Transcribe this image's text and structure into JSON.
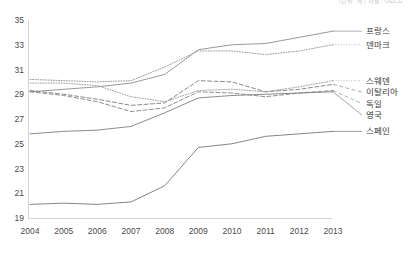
{
  "note": "(단위: 세) 자료: OECD",
  "chart_data": {
    "type": "line",
    "title": "",
    "xlabel": "",
    "ylabel": "",
    "grid": false,
    "legend_position": "right",
    "categories": [
      2004,
      2005,
      2006,
      2007,
      2008,
      2009,
      2010,
      2011,
      2012,
      2013
    ],
    "ylim": [
      19,
      35
    ],
    "ytick_step": 2,
    "yticks": [
      19,
      21,
      23,
      25,
      27,
      29,
      31,
      33,
      35
    ],
    "series": [
      {
        "name": "프랑스",
        "style": "solid",
        "color": "#8d8d8d",
        "values": [
          29.2,
          29.4,
          29.6,
          29.9,
          30.6,
          32.6,
          33.0,
          33.1,
          33.6,
          34.1
        ]
      },
      {
        "name": "덴마크",
        "style": "dotted",
        "color": "#9a9a9a",
        "values": [
          30.2,
          30.1,
          30.0,
          30.1,
          31.2,
          32.5,
          32.5,
          32.2,
          32.5,
          33.0
        ]
      },
      {
        "name": "스웨덴",
        "style": "dotted",
        "color": "#a0a0a0",
        "values": [
          29.9,
          29.9,
          29.7,
          28.8,
          28.4,
          29.3,
          29.4,
          29.2,
          29.6,
          30.1
        ]
      },
      {
        "name": "이탈리아",
        "style": "dashed",
        "color": "#8a8a8a",
        "values": [
          29.3,
          29.0,
          28.6,
          28.1,
          28.3,
          30.1,
          30.0,
          29.2,
          29.4,
          29.8
        ]
      },
      {
        "name": "독일",
        "style": "dashed",
        "color": "#909090",
        "values": [
          29.2,
          28.9,
          28.4,
          27.6,
          27.9,
          29.2,
          29.1,
          28.8,
          29.1,
          29.3
        ]
      },
      {
        "name": "영국",
        "style": "solid",
        "color": "#7e7e7e",
        "values": [
          25.8,
          26.0,
          26.1,
          26.4,
          27.5,
          28.7,
          28.9,
          29.0,
          29.1,
          29.2
        ]
      },
      {
        "name": "스페인",
        "style": "solid",
        "color": "#777777",
        "values": [
          20.1,
          20.2,
          20.1,
          20.3,
          21.6,
          24.7,
          25.0,
          25.6,
          25.8,
          26.0
        ]
      }
    ]
  }
}
